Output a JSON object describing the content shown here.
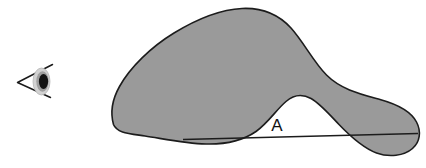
{
  "figure": {
    "background_color": "#ffffff"
  },
  "viewer": {
    "icon_name": "eye-icon",
    "cone_color": "#1a1a1a",
    "eyeball_color": "#cfcfcf",
    "iris_color": "#a6a6a6",
    "pupil_color": "#111111",
    "position": {
      "x": 14,
      "y": 62,
      "width": 42,
      "height": 42
    }
  },
  "blob": {
    "name": "shaded-blob",
    "fill_color": "#9a9a9a",
    "stroke_color": "#1c1c1c",
    "stroke_width": 1.6,
    "path": "M 113.5 124.5 C 110.0 112.0 112.5 99.0 119.5 86.5 C 130.0 67.5 151.0 47.0 174.0 33.0 C 197.0 19.0 221.0 9.5 242.0 8.5 C 263.0 7.5 279.0 15.0 291.0 28.0 C 304.0 42.5 313.5 62.0 326.5 75.0 C 341.0 89.5 360.0 94.0 380.0 99.5 C 398.0 104.5 411.0 111.5 416.5 122.0 C 421.5 131.5 420.0 142.0 412.5 148.5 C 404.0 156.0 389.0 157.5 376.5 153.0 C 362.0 147.5 350.0 136.0 339.0 124.5 C 329.0 114.0 320.0 103.5 311.0 98.5 C 302.0 93.5 294.0 94.5 286.0 101.5 C 276.5 109.5 268.0 123.0 256.0 131.5 C 243.0 140.5 227.0 144.5 206.0 144.0 C 185.0 143.5 162.0 138.5 145.0 136.0 C 128.5 133.5 117.0 133.0 113.5 124.5 Z"
  },
  "chord_line": {
    "name": "baseline-chord",
    "color": "#1c1c1c",
    "width": 1.4,
    "x1": 183,
    "y1": 139.5,
    "x2": 418,
    "y2": 133.5
  },
  "labels": {
    "region_a": {
      "text": "A",
      "x": 277,
      "y": 131,
      "color": "#111111"
    }
  }
}
